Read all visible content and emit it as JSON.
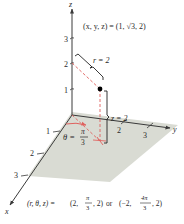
{
  "figure": {
    "type": "cylindrical-coordinates-diagram",
    "axes": {
      "x": {
        "label": "x",
        "ticks": [
          "1",
          "2",
          "3"
        ]
      },
      "y": {
        "label": "y",
        "ticks": [
          "2",
          "3"
        ]
      },
      "z": {
        "label": "z",
        "ticks": [
          "1",
          "2",
          "3"
        ]
      }
    },
    "point_label": "(x, y, z) = (1, √3, 2)",
    "r_label": "r = 2",
    "z_label": "z = 2",
    "theta_label_lhs": "θ =",
    "theta_num": "π",
    "theta_den": "3",
    "caption": {
      "lhs": "(r, θ, z) = ",
      "first_open": "(2, ",
      "first_num": "π",
      "first_den": "3",
      "first_close": ", 2)",
      "or": " or ",
      "second_open": "(−2, ",
      "second_num": "4π",
      "second_den": "3",
      "second_close": ", 2)"
    },
    "colors": {
      "plane": "#d9dbd3",
      "axis": "#3a3a3a",
      "guide": "#e0615e",
      "bracket": "#222222",
      "point": "#000000"
    }
  }
}
